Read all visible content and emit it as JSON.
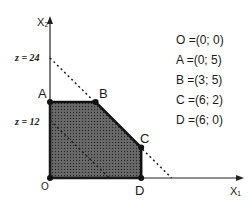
{
  "axes": {
    "x_label": "X₁",
    "y_label": "X₂"
  },
  "objective_lines": [
    {
      "label": "z = 24",
      "value": 24
    },
    {
      "label": "z = 12",
      "value": 12
    }
  ],
  "vertices": [
    {
      "name": "O",
      "x": 0,
      "y": 0,
      "text": "O =(0; 0)"
    },
    {
      "name": "A",
      "x": 0,
      "y": 5,
      "text": "A =(0; 5)"
    },
    {
      "name": "B",
      "x": 3,
      "y": 5,
      "text": "B =(3; 5)"
    },
    {
      "name": "C",
      "x": 6,
      "y": 2,
      "text": "C =(6; 2)"
    },
    {
      "name": "D",
      "x": 6,
      "y": 0,
      "text": "D =(6; 0)"
    }
  ],
  "colors": {
    "region": "#555555",
    "line": "#111111"
  }
}
